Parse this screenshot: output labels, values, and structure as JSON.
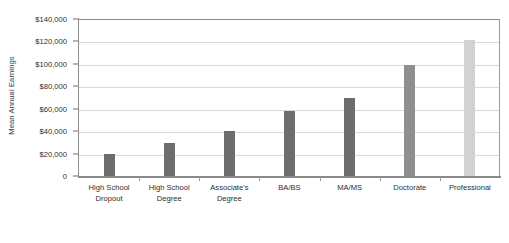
{
  "chart_data": {
    "type": "bar",
    "title": "",
    "xlabel": "",
    "ylabel": "Mean Annual Earnings",
    "ylim": [
      0,
      140000
    ],
    "ytick_values": [
      140000,
      120000,
      100000,
      80000,
      60000,
      40000,
      20000,
      0
    ],
    "ytick_labels": [
      "$140,000",
      "$120,000",
      "$100,000",
      "$80,000",
      "$60,000",
      "$40,000",
      "$20,000",
      "0"
    ],
    "grid": true,
    "legend": false,
    "categories": [
      "High School Dropout",
      "High School Degree",
      "Associate's Degree",
      "BA/BS",
      "MA/MS",
      "Doctorate",
      "Professional"
    ],
    "category_lines": [
      [
        "High School",
        "Dropout"
      ],
      [
        "High School",
        "Degree"
      ],
      [
        "Associate's",
        "Degree"
      ],
      [
        "BA/BS",
        ""
      ],
      [
        "MA/MS",
        ""
      ],
      [
        "Doctorate",
        ""
      ],
      [
        "Professional",
        ""
      ]
    ],
    "values": [
      20000,
      29500,
      40000,
      58000,
      70000,
      99000,
      121500
    ],
    "bar_colors": [
      "#6d6d6d",
      "#6d6d6d",
      "#6d6d6d",
      "#6d6d6d",
      "#6d6d6d",
      "#8f8f8f",
      "#d2d2d2"
    ],
    "bar_width_px": 11,
    "gridline_color": "#d9d9d9",
    "axis_color": "#8a8a8a",
    "background_color": "#ffffff",
    "text_color": "#2e2e2e"
  }
}
